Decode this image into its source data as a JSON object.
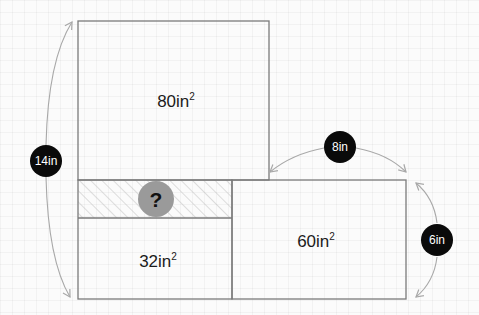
{
  "diagram": {
    "type": "area-composition-puzzle",
    "shapes": {
      "top_rect": {
        "label": "80in",
        "exponent": "2"
      },
      "bottom_left_rect": {
        "label": "32in",
        "exponent": "2"
      },
      "right_rect": {
        "label": "60in",
        "exponent": "2"
      },
      "unknown_band": {
        "label": "?"
      }
    },
    "dimensions": {
      "total_height": "14in",
      "right_top_width": "8in",
      "right_height": "6in"
    },
    "colors": {
      "outline": "#7a7a7a",
      "badge_fill": "#0a0a0a",
      "badge_text": "#ffffff",
      "question_circle": "#9a9a9a",
      "hatch": "#b8b8b8",
      "arrow": "#a8a8a8"
    }
  }
}
